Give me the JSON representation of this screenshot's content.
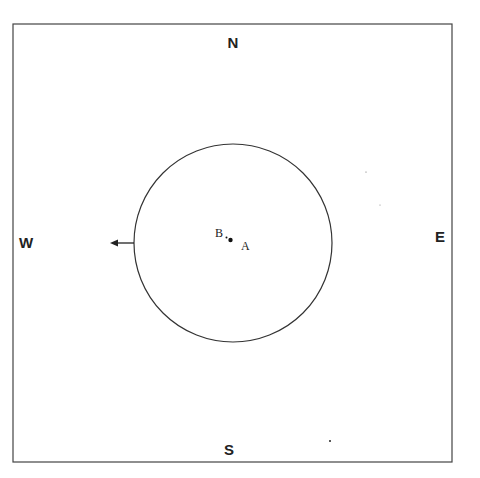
{
  "diagram": {
    "directions": {
      "north": "N",
      "south": "S",
      "east": "E",
      "west": "W"
    },
    "points": {
      "a": "A",
      "b": "B"
    },
    "colors": {
      "line": "#333333",
      "background": "#ffffff"
    }
  }
}
